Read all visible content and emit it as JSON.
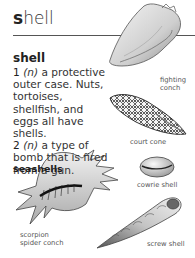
{
  "page": {
    "title_initial": "s",
    "title_rest": "hell",
    "headword": "shell",
    "definitions": [
      {
        "number": "1",
        "pos": "(n)",
        "text": " a protective outer case. Nuts, tortoises, shellfish, and eggs all have shells."
      },
      {
        "number": "2",
        "pos": "(n)",
        "text": " a type of bomb that is fired from a gun."
      }
    ],
    "subheading": "seashells"
  },
  "illustrations": [
    {
      "name": "fighting-conch",
      "caption_line1": "fighting",
      "caption_line2": "conch"
    },
    {
      "name": "court-cone",
      "caption": "court cone"
    },
    {
      "name": "cowrie-shell",
      "caption": "cowrie shell"
    },
    {
      "name": "scorpion-spider-conch",
      "caption_line1": "scorpion",
      "caption_line2": "spider conch"
    },
    {
      "name": "screw-shell",
      "caption": "screw shell"
    }
  ]
}
